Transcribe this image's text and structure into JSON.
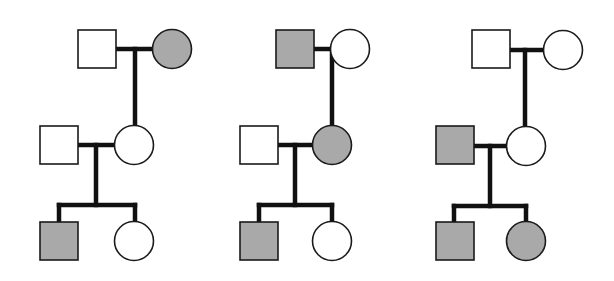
{
  "diagram": {
    "type": "pedigree-charts",
    "colors": {
      "affected_fill": "#a9a9a9",
      "unaffected_fill": "#ffffff",
      "line": "#111111",
      "outline": "#1a1a1a"
    },
    "symbol_size": 39,
    "pedigrees": [
      {
        "id": "pedigree-1",
        "individuals": [
          {
            "id": "p1-gen1-male",
            "sex": "male",
            "affected": false,
            "x": 78,
            "y": 30
          },
          {
            "id": "p1-gen1-female",
            "sex": "female",
            "affected": true,
            "cx": 172,
            "cy": 49
          },
          {
            "id": "p1-gen2-male",
            "sex": "male",
            "affected": false,
            "x": 40,
            "y": 126
          },
          {
            "id": "p1-gen2-female",
            "sex": "female",
            "affected": false,
            "cx": 134,
            "cy": 145
          },
          {
            "id": "p1-gen3-male",
            "sex": "male",
            "affected": true,
            "x": 40,
            "y": 222
          },
          {
            "id": "p1-gen3-female",
            "sex": "female",
            "affected": false,
            "cx": 134,
            "cy": 241
          }
        ],
        "lines": [
          {
            "x1": 117,
            "y1": 49,
            "x2": 153,
            "y2": 49
          },
          {
            "x1": 135,
            "y1": 49,
            "x2": 135,
            "y2": 125
          },
          {
            "x1": 78,
            "y1": 145,
            "x2": 114,
            "y2": 145
          },
          {
            "x1": 96,
            "y1": 145,
            "x2": 96,
            "y2": 205
          },
          {
            "x1": 59,
            "y1": 205,
            "x2": 135,
            "y2": 205
          },
          {
            "x1": 59,
            "y1": 205,
            "x2": 59,
            "y2": 222
          },
          {
            "x1": 135,
            "y1": 205,
            "x2": 135,
            "y2": 221
          }
        ]
      },
      {
        "id": "pedigree-2",
        "individuals": [
          {
            "id": "p2-gen1-male",
            "sex": "male",
            "affected": true,
            "x": 276,
            "y": 30
          },
          {
            "id": "p2-gen1-female",
            "sex": "female",
            "affected": false,
            "cx": 350,
            "cy": 49
          },
          {
            "id": "p2-gen2-male",
            "sex": "male",
            "affected": false,
            "x": 240,
            "y": 126
          },
          {
            "id": "p2-gen2-female",
            "sex": "female",
            "affected": true,
            "cx": 332,
            "cy": 145
          },
          {
            "id": "p2-gen3-male",
            "sex": "male",
            "affected": true,
            "x": 240,
            "y": 222
          },
          {
            "id": "p2-gen3-female",
            "sex": "female",
            "affected": false,
            "cx": 332,
            "cy": 241
          }
        ],
        "lines": [
          {
            "x1": 315,
            "y1": 49,
            "x2": 331,
            "y2": 49
          },
          {
            "x1": 332,
            "y1": 49,
            "x2": 332,
            "y2": 125
          },
          {
            "x1": 279,
            "y1": 145,
            "x2": 312,
            "y2": 145
          },
          {
            "x1": 295,
            "y1": 145,
            "x2": 295,
            "y2": 205
          },
          {
            "x1": 259,
            "y1": 205,
            "x2": 332,
            "y2": 205
          },
          {
            "x1": 259,
            "y1": 205,
            "x2": 259,
            "y2": 222
          },
          {
            "x1": 332,
            "y1": 205,
            "x2": 332,
            "y2": 221
          }
        ]
      },
      {
        "id": "pedigree-3",
        "individuals": [
          {
            "id": "p3-gen1-male",
            "sex": "male",
            "affected": false,
            "x": 472,
            "y": 30
          },
          {
            "id": "p3-gen1-female",
            "sex": "female",
            "affected": false,
            "cx": 563,
            "cy": 50
          },
          {
            "id": "p3-gen2-male",
            "sex": "male",
            "affected": true,
            "x": 436,
            "y": 126
          },
          {
            "id": "p3-gen2-female",
            "sex": "female",
            "affected": false,
            "cx": 526,
            "cy": 146
          },
          {
            "id": "p3-gen3-male",
            "sex": "male",
            "affected": true,
            "x": 436,
            "y": 222
          },
          {
            "id": "p3-gen3-female",
            "sex": "female",
            "affected": true,
            "cx": 526,
            "cy": 241
          }
        ],
        "lines": [
          {
            "x1": 511,
            "y1": 50,
            "x2": 544,
            "y2": 50
          },
          {
            "x1": 525,
            "y1": 50,
            "x2": 525,
            "y2": 126
          },
          {
            "x1": 475,
            "y1": 146,
            "x2": 507,
            "y2": 146
          },
          {
            "x1": 490,
            "y1": 146,
            "x2": 490,
            "y2": 206
          },
          {
            "x1": 454,
            "y1": 206,
            "x2": 526,
            "y2": 206
          },
          {
            "x1": 454,
            "y1": 206,
            "x2": 454,
            "y2": 222
          },
          {
            "x1": 526,
            "y1": 206,
            "x2": 526,
            "y2": 221
          }
        ]
      }
    ]
  }
}
